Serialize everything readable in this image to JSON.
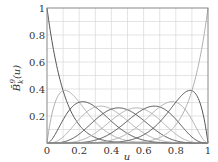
{
  "chart_data": {
    "type": "line",
    "title": "",
    "xlabel": "u",
    "ylabel": "B̄_k^9(u)",
    "xlim": [
      0,
      1
    ],
    "ylim": [
      0,
      1
    ],
    "grid": true,
    "x_ticks": [
      "0",
      "0.2",
      "0.4",
      "0.6",
      "0.8",
      "1"
    ],
    "y_ticks": [
      "0.2",
      "0.4",
      "0.6",
      "0.8",
      "1"
    ],
    "x_tick_values": [
      0,
      0.2,
      0.4,
      0.6,
      0.8,
      1
    ],
    "y_tick_values": [
      0.2,
      0.4,
      0.6,
      0.8,
      1
    ],
    "degree": 9,
    "series": [
      {
        "name": "k=0",
        "color": "#555555",
        "peak": {
          "u": 0.0,
          "value": 1.0
        }
      },
      {
        "name": "k=1",
        "color": "#b0b0b0",
        "peak": {
          "u": 0.111,
          "value": 0.387
        }
      },
      {
        "name": "k=2",
        "color": "#555555",
        "peak": {
          "u": 0.222,
          "value": 0.302
        }
      },
      {
        "name": "k=3",
        "color": "#b0b0b0",
        "peak": {
          "u": 0.333,
          "value": 0.273
        }
      },
      {
        "name": "k=4",
        "color": "#555555",
        "peak": {
          "u": 0.444,
          "value": 0.26
        }
      },
      {
        "name": "k=5",
        "color": "#b0b0b0",
        "peak": {
          "u": 0.556,
          "value": 0.26
        }
      },
      {
        "name": "k=6",
        "color": "#555555",
        "peak": {
          "u": 0.667,
          "value": 0.273
        }
      },
      {
        "name": "k=7",
        "color": "#b0b0b0",
        "peak": {
          "u": 0.778,
          "value": 0.302
        }
      },
      {
        "name": "k=8",
        "color": "#555555",
        "peak": {
          "u": 0.889,
          "value": 0.387
        }
      },
      {
        "name": "k=9",
        "color": "#b0b0b0",
        "peak": {
          "u": 1.0,
          "value": 1.0
        }
      }
    ],
    "legend": "none"
  },
  "colors": {
    "grid": "#d8d8d8",
    "frame": "#888888",
    "dark": "#555555",
    "light": "#b0b0b0"
  }
}
